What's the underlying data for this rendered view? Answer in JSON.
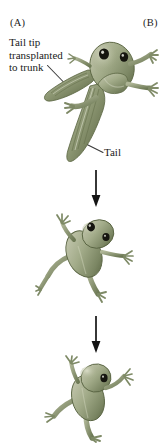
{
  "figure": {
    "background_color": "#ffffff",
    "width": 163,
    "height": 444
  },
  "panels": {
    "a": {
      "letter": "(A)"
    },
    "b": {
      "letter": "(B)"
    }
  },
  "labels": {
    "transplant": {
      "line1": "Tail tip",
      "line2": "transplanted",
      "line3": "to trunk"
    },
    "tail": "Tail"
  },
  "colors": {
    "text": "#1a1a1a",
    "leader_line": "#3a3a3a",
    "arrow": "#141414",
    "body_light": "#b9bda6",
    "body_mid": "#97a07f",
    "body_dark": "#6f7a57",
    "body_shadow": "#4e5839",
    "tail_stripe": "#68734f",
    "eye": "#15150f",
    "eye_highlight": "#e8e9df",
    "belly_highlight": "#d2d6bf"
  },
  "stages": [
    {
      "name": "tadpole-with-transplanted-tail-tip",
      "order": 1,
      "description": "Tadpole bearing a second tail tip grafted onto the trunk"
    },
    {
      "name": "froglet-intermediate",
      "order": 2,
      "description": "Metamorphosing froglet, tail resorbed"
    },
    {
      "name": "froglet-final",
      "order": 3,
      "description": "Fully metamorphosed froglet"
    }
  ],
  "arrows": [
    {
      "name": "arrow-stage-1-to-2",
      "direction": "down"
    },
    {
      "name": "arrow-stage-2-to-3",
      "direction": "down"
    }
  ]
}
